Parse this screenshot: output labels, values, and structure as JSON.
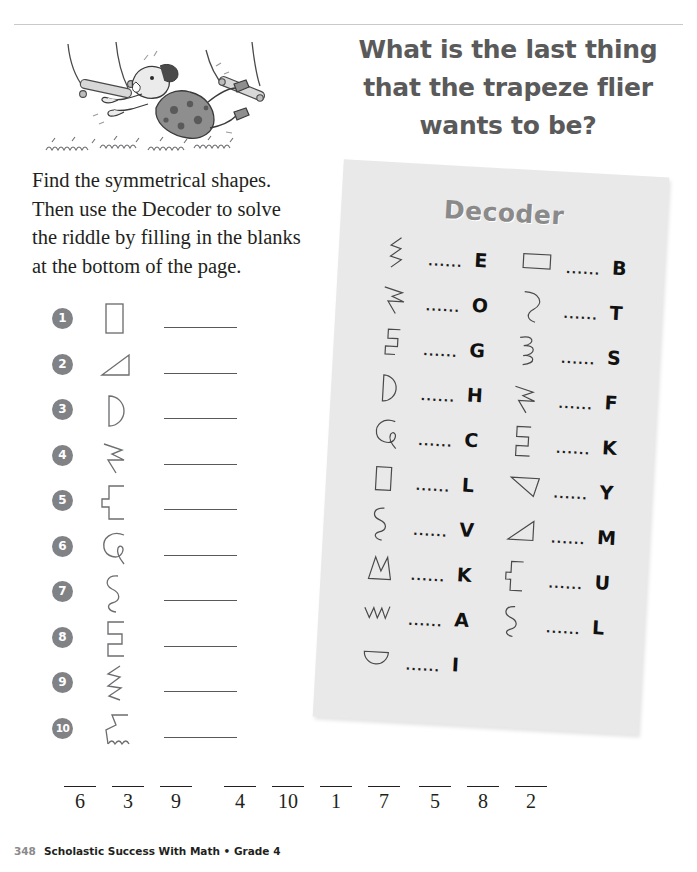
{
  "page": {
    "riddle_title_line1": "What is the last thing",
    "riddle_title_line2": "that the trapeze flier",
    "riddle_title_line3": "wants to be?",
    "instructions_line1": "Find the symmetrical shapes.",
    "instructions_line2": "Then use the Decoder to solve",
    "instructions_line3": "the riddle by filling in the blanks",
    "instructions_line4": "at the bottom of the page.",
    "illustration_alt": "trapeze-flier-falling-cartoon"
  },
  "problems": [
    {
      "number": "1",
      "shape": "rectangle"
    },
    {
      "number": "2",
      "shape": "right-triangle"
    },
    {
      "number": "3",
      "shape": "half-circle"
    },
    {
      "number": "4",
      "shape": "zigzag-arrow"
    },
    {
      "number": "5",
      "shape": "stepped-bracket"
    },
    {
      "number": "6",
      "shape": "hook-curve"
    },
    {
      "number": "7",
      "shape": "s-wave"
    },
    {
      "number": "8",
      "shape": "double-step"
    },
    {
      "number": "9",
      "shape": "lightning-zigzag"
    },
    {
      "number": "10",
      "shape": "step-with-squiggle"
    }
  ],
  "decoder": {
    "title": "Decoder",
    "dots": "......",
    "left_column": [
      {
        "letter": "E",
        "shape": "lightning-zigzag"
      },
      {
        "letter": "O",
        "shape": "zigzag-arrow"
      },
      {
        "letter": "G",
        "shape": "step-notch"
      },
      {
        "letter": "H",
        "shape": "half-circle"
      },
      {
        "letter": "C",
        "shape": "hook-curve"
      },
      {
        "letter": "L",
        "shape": "rectangle"
      },
      {
        "letter": "V",
        "shape": "s-wave"
      },
      {
        "letter": "K",
        "shape": "zigzag-peak"
      },
      {
        "letter": "A",
        "shape": "low-zigzag"
      },
      {
        "letter": "I",
        "shape": "half-circle-down"
      }
    ],
    "right_column": [
      {
        "letter": "B",
        "shape": "wide-rectangle"
      },
      {
        "letter": "T",
        "shape": "c-curve"
      },
      {
        "letter": "S",
        "shape": "coil-spiral"
      },
      {
        "letter": "F",
        "shape": "zigzag-arrow"
      },
      {
        "letter": "K",
        "shape": "double-step"
      },
      {
        "letter": "Y",
        "shape": "right-triangle-down"
      },
      {
        "letter": "M",
        "shape": "right-triangle-up"
      },
      {
        "letter": "U",
        "shape": "stepped-bracket"
      },
      {
        "letter": "L",
        "shape": "s-wave"
      }
    ]
  },
  "answer_bank": {
    "groups": [
      {
        "slots": [
          "6",
          "3",
          "9"
        ]
      },
      {
        "slots": [
          "4",
          "10",
          "1",
          "7"
        ]
      },
      {
        "slots": [
          "5",
          "8",
          "2"
        ]
      }
    ]
  },
  "footer": {
    "page_number": "348",
    "title": "Scholastic Success With Math • Grade 4"
  },
  "colors": {
    "badge_gray": "#808285",
    "panel_gray": "#e9e9e9",
    "title_gray": "#5a5a5a",
    "decoder_title_gray": "#8a8a8a",
    "ink": "#231f20"
  }
}
